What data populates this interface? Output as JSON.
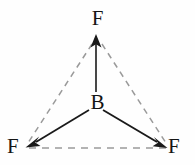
{
  "diagram": {
    "type": "molecular-structure",
    "background_color": "#fefefe",
    "bond_color": "#1a1a1a",
    "guide_color": "#9a9a9a",
    "label_color": "#141414",
    "atoms": [
      {
        "id": "f-top",
        "label": "F",
        "x": 97,
        "y": 18,
        "role": "terminal"
      },
      {
        "id": "b-center",
        "label": "B",
        "x": 95,
        "y": 103,
        "role": "central"
      },
      {
        "id": "f-bottom-left",
        "label": "F",
        "x": 15,
        "y": 146,
        "role": "terminal"
      },
      {
        "id": "f-bottom-right",
        "label": "F",
        "x": 176,
        "y": 146,
        "role": "terminal"
      }
    ],
    "bonds": [
      {
        "id": "bond-b-f-top",
        "from": "b-center",
        "to": "f-top",
        "style": "solid-arrow"
      },
      {
        "id": "bond-b-f-bottom-left",
        "from": "b-center",
        "to": "f-bottom-left",
        "style": "solid-arrow"
      },
      {
        "id": "bond-b-f-bottom-right",
        "from": "b-center",
        "to": "f-bottom-right",
        "style": "solid-arrow"
      }
    ],
    "guides": [
      {
        "id": "guide-left",
        "from": "f-top",
        "to": "f-bottom-left",
        "style": "dashed"
      },
      {
        "id": "guide-right",
        "from": "f-top",
        "to": "f-bottom-right",
        "style": "dashed"
      },
      {
        "id": "guide-bottom",
        "from": "f-bottom-left",
        "to": "f-bottom-right",
        "style": "dashed"
      }
    ]
  }
}
